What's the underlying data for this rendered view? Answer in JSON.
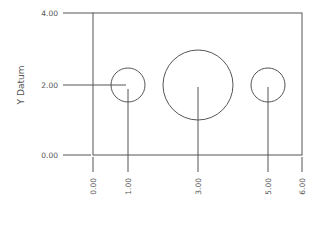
{
  "diagram": {
    "type": "ordinate-dimension-drawing",
    "y_axis_title": "Y Datum",
    "stroke_color": "#555555",
    "frame": {
      "x_min": 0.0,
      "x_max": 6.0,
      "y_min": 0.0,
      "y_max": 4.0
    },
    "y_labels": [
      {
        "value": 4.0,
        "text": "4.00"
      },
      {
        "value": 2.0,
        "text": "2.00"
      },
      {
        "value": 0.0,
        "text": "0.00"
      }
    ],
    "x_labels": [
      {
        "value": 0.0,
        "text": "0.00"
      },
      {
        "value": 1.0,
        "text": "1.00"
      },
      {
        "value": 3.0,
        "text": "3.00"
      },
      {
        "value": 5.0,
        "text": "5.00"
      },
      {
        "value": 6.0,
        "text": "6.00"
      }
    ],
    "circles": [
      {
        "cx": 1.0,
        "cy": 2.0,
        "r": 0.5
      },
      {
        "cx": 3.0,
        "cy": 2.0,
        "r": 1.0
      },
      {
        "cx": 5.0,
        "cy": 2.0,
        "r": 0.5
      }
    ]
  }
}
